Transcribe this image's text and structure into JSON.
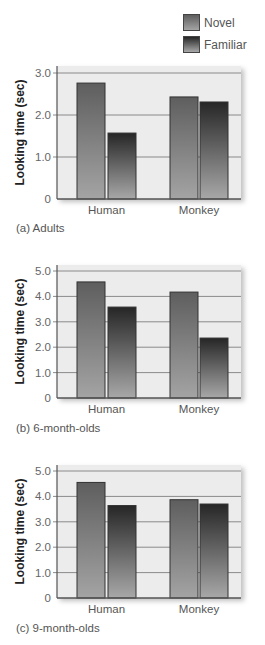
{
  "legend": {
    "items": [
      {
        "label": "Novel",
        "color_top": "#5a5a5a",
        "color_bottom": "#8e8e8e"
      },
      {
        "label": "Familiar",
        "color_top": "#2a2a2a",
        "color_bottom": "#9a9a9a"
      }
    ]
  },
  "colors": {
    "plot_bg": "#ececec",
    "gridline": "#8a8a8a",
    "axis": "#555555",
    "novel_top": "#5e5e5e",
    "novel_bottom": "#a4a4a4",
    "familiar_top": "#262626",
    "familiar_bottom": "#a8a8a8",
    "bar_edge": "#333333"
  },
  "chart_data": [
    {
      "type": "bar",
      "title": "",
      "caption": "(a) Adults",
      "xlabel": "",
      "ylabel": "Looking time (sec)",
      "categories": [
        "Human",
        "Monkey"
      ],
      "series": [
        {
          "name": "Novel",
          "values": [
            2.76,
            2.43
          ]
        },
        {
          "name": "Familiar",
          "values": [
            1.57,
            2.31
          ]
        }
      ],
      "ylim": [
        0,
        3.2
      ],
      "yticks": [
        0,
        1,
        2,
        3
      ],
      "ytick_labels": [
        "0",
        "1.0",
        "2.0",
        "3.0"
      ],
      "grid": true,
      "legend": "top-right"
    },
    {
      "type": "bar",
      "title": "",
      "caption": "(b) 6-month-olds",
      "xlabel": "",
      "ylabel": "Looking time (sec)",
      "categories": [
        "Human",
        "Monkey"
      ],
      "series": [
        {
          "name": "Novel",
          "values": [
            4.57,
            4.17
          ]
        },
        {
          "name": "Familiar",
          "values": [
            3.58,
            2.36
          ]
        }
      ],
      "ylim": [
        0,
        5.2
      ],
      "yticks": [
        0,
        1,
        2,
        3,
        4,
        5
      ],
      "ytick_labels": [
        "0",
        "1.0",
        "2.0",
        "3.0",
        "4.0",
        "5.0"
      ],
      "grid": true,
      "legend": "top-right"
    },
    {
      "type": "bar",
      "title": "",
      "caption": "(c) 9-month-olds",
      "xlabel": "",
      "ylabel": "Looking time (sec)",
      "categories": [
        "Human",
        "Monkey"
      ],
      "series": [
        {
          "name": "Novel",
          "values": [
            4.55,
            3.87
          ]
        },
        {
          "name": "Familiar",
          "values": [
            3.64,
            3.7
          ]
        }
      ],
      "ylim": [
        0,
        5.2
      ],
      "yticks": [
        0,
        1,
        2,
        3,
        4,
        5
      ],
      "ytick_labels": [
        "0",
        "1.0",
        "2.0",
        "3.0",
        "4.0",
        "5.0"
      ],
      "grid": true,
      "legend": "top-right"
    }
  ]
}
